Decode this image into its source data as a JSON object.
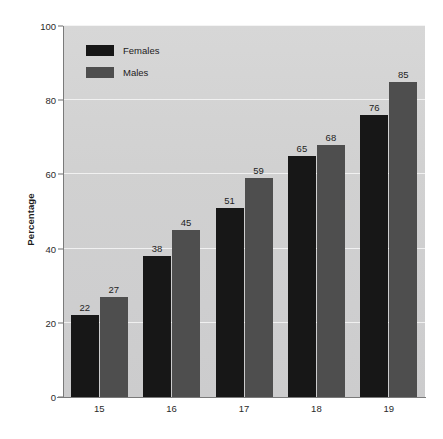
{
  "chart_data": {
    "type": "bar",
    "title": "",
    "xlabel": "",
    "ylabel": "Percentage",
    "categories": [
      "15",
      "16",
      "17",
      "18",
      "19"
    ],
    "series": [
      {
        "name": "Females",
        "color": "#171717",
        "values": [
          22,
          38,
          51,
          65,
          76
        ]
      },
      {
        "name": "Males",
        "color": "#4e4e4e",
        "values": [
          27,
          45,
          59,
          68,
          85
        ]
      }
    ],
    "ylim": [
      0,
      100
    ],
    "yticks": [
      0,
      20,
      40,
      60,
      80,
      100
    ],
    "ytick_labels": [
      "0",
      "20",
      "40",
      "60",
      "80",
      "100"
    ],
    "grid": true,
    "gridline_color": "#f3f3f3",
    "legend_position": "top-left",
    "plot_background": "#d2d2d2",
    "figure_background": "#ffffff",
    "data_labels": true
  },
  "legend": {
    "entries": [
      {
        "label": "Females",
        "color": "#171717"
      },
      {
        "label": "Males",
        "color": "#4e4e4e"
      }
    ]
  },
  "axes": {
    "y_title": "Percentage",
    "y_tick_labels": [
      "100",
      "80",
      "60",
      "40",
      "20",
      "0"
    ],
    "x_tick_labels": [
      "15",
      "16",
      "17",
      "18",
      "19"
    ]
  }
}
